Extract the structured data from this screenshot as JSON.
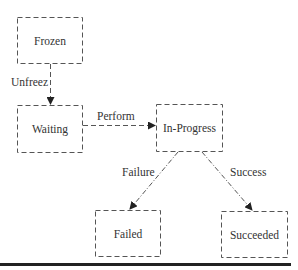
{
  "diagram": {
    "type": "state-transition",
    "states": [
      {
        "id": "frozen",
        "label": "Frozen"
      },
      {
        "id": "waiting",
        "label": "Waiting"
      },
      {
        "id": "in_progress",
        "label": "In-Progress"
      },
      {
        "id": "failed",
        "label": "Failed"
      },
      {
        "id": "succeeded",
        "label": "Succeeded"
      }
    ],
    "transitions": [
      {
        "from": "frozen",
        "to": "waiting",
        "label": "Unfreez",
        "style": "dashed"
      },
      {
        "from": "waiting",
        "to": "in_progress",
        "label": "Perform",
        "style": "dashed"
      },
      {
        "from": "in_progress",
        "to": "failed",
        "label": "Failure",
        "style": "dash-dot"
      },
      {
        "from": "in_progress",
        "to": "succeeded",
        "label": "Success",
        "style": "dash-dot"
      }
    ],
    "colors": {
      "stroke": "#555555",
      "text": "#333333",
      "rule": "#222222"
    }
  }
}
